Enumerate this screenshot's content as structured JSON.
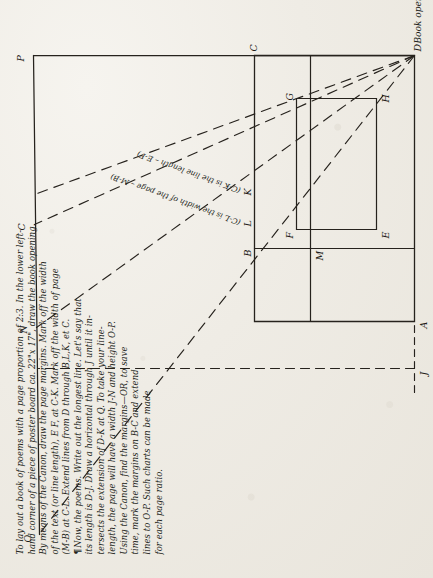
{
  "document": {
    "type": "handwritten-diagram-page",
    "orientation_deg": -90,
    "paper_color": "#efece6",
    "ink_color": "#241f1a"
  },
  "instructions": {
    "lines": [
      "To lay out a book of poems with a page proportion of 2:3.  In the lower left-",
      "hand corner of a piece of poster board  ca. 22\"x 17\", draw the book opening.",
      "By means of the Canon, draw the page margins.  Mark off the width",
      "of the text (or line length), E F, at C-K.  Mark off the width of page",
      "(M-B) at C-L. Extend lines from D through B,L,K, et C.",
      "Now, the poems.  Write out the longest line.  Let's say that",
      "its length is D-J.  Draw a horizontal through J until  it in-",
      "tersects the extension of D-K at Q.  To take your line-",
      "length, the page will have a width J-N and height O-P.",
      "Using the Canon, find the margins—OR, to save",
      "time, mark the margins on B-C and extend",
      "lines to O-P.   Such charts can be made",
      "for each page ratio."
    ],
    "pilcrow_lines": [
      5,
      11
    ],
    "pilcrow_glyph": "¶"
  },
  "diagram": {
    "caption": "Book opening with single page",
    "point_labels": [
      {
        "id": "O",
        "text": "O"
      },
      {
        "id": "N",
        "text": "N"
      },
      {
        "id": "C_top",
        "text": "C"
      },
      {
        "id": "P",
        "text": "P"
      },
      {
        "id": "J",
        "text": "J"
      },
      {
        "id": "A",
        "text": "A"
      },
      {
        "id": "M",
        "text": "M"
      },
      {
        "id": "B",
        "text": "B"
      },
      {
        "id": "E",
        "text": "E"
      },
      {
        "id": "F",
        "text": "F"
      },
      {
        "id": "G",
        "text": "G"
      },
      {
        "id": "H",
        "text": "H"
      },
      {
        "id": "D",
        "text": "D"
      },
      {
        "id": "C_bottom",
        "text": "C"
      },
      {
        "id": "L",
        "text": "L"
      },
      {
        "id": "K",
        "text": "K"
      }
    ],
    "annotations": [
      {
        "id": "width-note",
        "text": "(C-L is the width of the page – M-B)"
      },
      {
        "id": "linelength-note",
        "text": "(C-K is the line length – E-F)"
      }
    ]
  }
}
